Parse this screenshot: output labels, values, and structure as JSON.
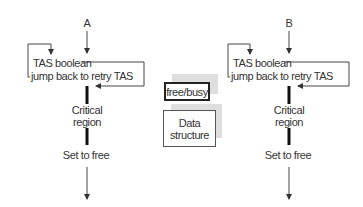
{
  "diagram": {
    "processes": [
      {
        "name": "A",
        "tas_line": "TAS boolean",
        "jump_line": "jump back to retry TAS",
        "critical_line1": "Critical",
        "critical_line2": "region",
        "set_free": "Set to free"
      },
      {
        "name": "B",
        "tas_line": "TAS boolean",
        "jump_line": "jump back to retry TAS",
        "critical_line1": "Critical",
        "critical_line2": "region",
        "set_free": "Set to free"
      }
    ],
    "shared": {
      "flag_label": "free/busy",
      "data_label_line1": "Data",
      "data_label_line2": "structure"
    },
    "colors": {
      "line": "#444444",
      "bar": "#111111",
      "shadow": "#dedede"
    }
  }
}
